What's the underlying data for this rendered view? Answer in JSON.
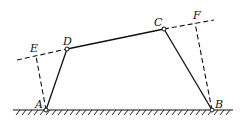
{
  "diagram": {
    "type": "four-bar linkage",
    "points": {
      "A": {
        "label": "A",
        "x": 46,
        "y": 110
      },
      "B": {
        "label": "B",
        "x": 212,
        "y": 110
      },
      "C": {
        "label": "C",
        "x": 164,
        "y": 29
      },
      "D": {
        "label": "D",
        "x": 67,
        "y": 49
      },
      "E": {
        "label": "E",
        "x": 36,
        "y": 56
      },
      "F": {
        "label": "F",
        "x": 195,
        "y": 23
      }
    },
    "links": [
      {
        "from": "A",
        "to": "D",
        "style": "solid"
      },
      {
        "from": "D",
        "to": "C",
        "style": "solid"
      },
      {
        "from": "C",
        "to": "B",
        "style": "solid"
      },
      {
        "from": "A",
        "to": "E",
        "style": "dashed"
      },
      {
        "from": "B",
        "to": "F",
        "style": "dashed"
      },
      {
        "from": "E",
        "to": "D",
        "style": "dashed"
      },
      {
        "from": "C",
        "to": "F",
        "style": "dashed"
      }
    ],
    "ground": {
      "x1": 13,
      "x2": 233,
      "y": 110
    },
    "colors": {
      "line": "#111111",
      "background": "#ffffff"
    }
  }
}
